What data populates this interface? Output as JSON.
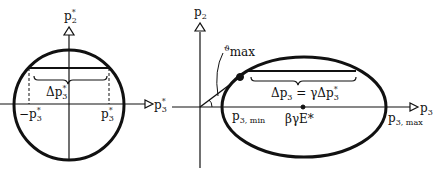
{
  "left_panel": {
    "y_axis": "p",
    "y_axis_sub": "2",
    "y_axis_sup": "*",
    "x_axis": "p",
    "x_axis_sub": "3",
    "x_axis_sup": "*",
    "brace_label": "Δp",
    "brace_sub": "3",
    "brace_sup": "*",
    "neg_tick": "−p",
    "neg_tick_sub": "3",
    "neg_tick_sup": "*",
    "pos_tick": "p",
    "pos_tick_sub": "3",
    "pos_tick_sup": "*"
  },
  "right_panel": {
    "y_axis": "p",
    "y_axis_sub": "2",
    "x_axis": "p",
    "x_axis_sub": "3",
    "angle_label": "ϑ",
    "angle_sub": "max",
    "brace_label_lhs": "Δp",
    "brace_lhs_sub": "3",
    "brace_label_rhs": " = γΔp",
    "brace_rhs_sub": "3",
    "brace_rhs_sup": "*",
    "min_label": "p",
    "min_sub": "3, min",
    "center_label": "βγE*",
    "max_label": "p",
    "max_sub": "3, max"
  },
  "colors": {
    "ink": "#111111",
    "background": "#ffffff"
  }
}
